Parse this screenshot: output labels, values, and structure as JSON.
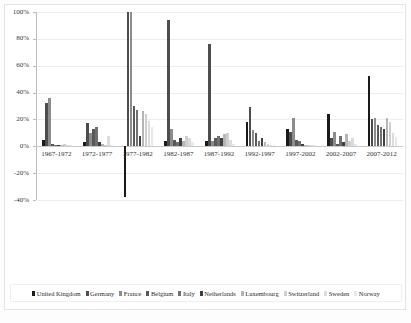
{
  "chart_data": {
    "type": "bar",
    "title": "",
    "subtitle": "",
    "xlabel": "",
    "ylabel": "",
    "ylim": [
      -40,
      100
    ],
    "grid": true,
    "legend_position": "bottom",
    "ytick_labels": [
      "100%",
      "80%",
      "60%",
      "40%",
      "20%",
      "0%",
      "-20%",
      "-40%"
    ],
    "ytick_values": [
      100,
      80,
      60,
      40,
      20,
      0,
      -20,
      -40
    ],
    "categories": [
      "1967-1972",
      "1972-1977",
      "1977-1982",
      "1982-1987",
      "1987-1992",
      "1992-1997",
      "1997-2002",
      "2002-2007",
      "2007-2012"
    ],
    "series": [
      {
        "name": "United Kingdom",
        "color": "#1a1a1a",
        "values": [
          5,
          3,
          -38,
          4,
          4,
          18,
          13,
          24,
          52
        ]
      },
      {
        "name": "Germany",
        "color": "#4d4d4d",
        "values": [
          32,
          17,
          100,
          94,
          76,
          29,
          11,
          6,
          20
        ]
      },
      {
        "name": "France",
        "color": "#8c8c8c",
        "values": [
          36,
          10,
          100,
          13,
          4,
          12,
          21,
          11,
          21
        ]
      },
      {
        "name": "Belgium",
        "color": "#595959",
        "values": [
          2,
          13,
          30,
          5,
          6,
          10,
          5,
          2,
          16
        ]
      },
      {
        "name": "Italy",
        "color": "#707070",
        "values": [
          1,
          14,
          27,
          3,
          8,
          4,
          4,
          8,
          14
        ]
      },
      {
        "name": "Netherlands",
        "color": "#3f3f3f",
        "values": [
          1,
          3,
          8,
          6,
          6,
          6,
          2,
          3,
          13
        ]
      },
      {
        "name": "Luxembourg",
        "color": "#b5b5b5",
        "values": [
          1,
          2,
          26,
          4,
          9,
          3,
          1,
          9,
          21
        ]
      },
      {
        "name": "Switzerland",
        "color": "#cfcfcf",
        "values": [
          2,
          1,
          24,
          8,
          10,
          2,
          1,
          4,
          18
        ]
      },
      {
        "name": "Sweden",
        "color": "#dcdcdc",
        "values": [
          1,
          8,
          19,
          6,
          5,
          1,
          1,
          6,
          10
        ]
      },
      {
        "name": "Norway",
        "color": "#e8e8e8",
        "values": [
          1,
          1,
          14,
          3,
          2,
          1,
          1,
          2,
          7
        ]
      }
    ]
  },
  "caption": {
    "text": ""
  }
}
